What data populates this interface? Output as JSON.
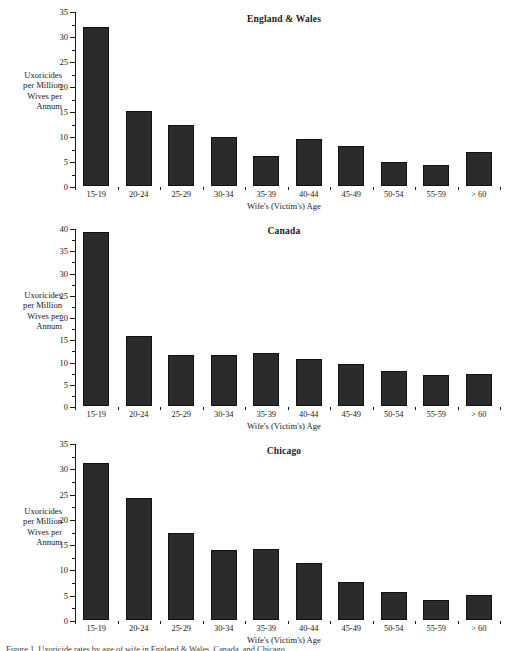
{
  "figure": {
    "background": "#ffffff",
    "bar_color": "#2b2b2b",
    "axis_color": "#1a1a1a",
    "caption_partial": "Figure 1. Uxoricide rates by age of wife in England & Wales, Canada, and Chicago."
  },
  "axes_common": {
    "ylabel_lines": [
      "Uxoricides",
      "per Million",
      "Wives per",
      "Annum"
    ],
    "ylabel_text": "Uxoricides per Million Wives per Annum",
    "xlabel": "Wife's (Victim's) Age",
    "categories": [
      "15-19",
      "20-24",
      "25-29",
      "30-34",
      "35-39",
      "40-44",
      "45-49",
      "50-54",
      "55-59",
      "> 60"
    ]
  },
  "chart_data": [
    {
      "type": "bar",
      "title": "England & Wales",
      "xlabel": "Wife's (Victim's) Age",
      "ylabel": "Uxoricides per Million Wives per Annum",
      "categories": [
        "15-19",
        "20-24",
        "25-29",
        "30-34",
        "35-39",
        "40-44",
        "45-49",
        "50-54",
        "55-59",
        "> 60"
      ],
      "values": [
        31.8,
        15.0,
        12.2,
        9.7,
        6.0,
        9.4,
        7.9,
        4.7,
        4.2,
        6.7
      ],
      "ylim": [
        0,
        35
      ],
      "yticks": [
        0,
        5,
        10,
        15,
        20,
        25,
        30,
        35
      ],
      "yminor_step": 2.5,
      "grid": false,
      "legend": "none"
    },
    {
      "type": "bar",
      "title": "Canada",
      "xlabel": "Wife's (Victim's) Age",
      "ylabel": "Uxoricides per Million Wives per Annum",
      "categories": [
        "15-19",
        "20-24",
        "25-29",
        "30-34",
        "35-39",
        "40-44",
        "45-49",
        "50-54",
        "55-59",
        "> 60"
      ],
      "values": [
        39.0,
        15.8,
        11.4,
        11.5,
        11.9,
        10.6,
        9.4,
        7.8,
        7.0,
        7.2
      ],
      "ylim": [
        0,
        40
      ],
      "yticks": [
        0,
        5,
        10,
        15,
        20,
        25,
        30,
        35,
        40
      ],
      "yminor_step": 2.5,
      "grid": false,
      "legend": "none"
    },
    {
      "type": "bar",
      "title": "Chicago",
      "xlabel": "Wife's (Victim's) Age",
      "ylabel": "Uxoricides per Million Wives per Annum",
      "categories": [
        "15-19",
        "20-24",
        "25-29",
        "30-34",
        "35-39",
        "40-44",
        "45-49",
        "50-54",
        "55-59",
        "> 60"
      ],
      "values": [
        31.1,
        24.0,
        17.2,
        13.8,
        14.1,
        11.2,
        7.4,
        5.6,
        3.9,
        5.0
      ],
      "ylim": [
        0,
        35
      ],
      "yticks": [
        0,
        5,
        10,
        15,
        20,
        25,
        30,
        35
      ],
      "yminor_step": 2.5,
      "grid": false,
      "legend": "none"
    }
  ]
}
